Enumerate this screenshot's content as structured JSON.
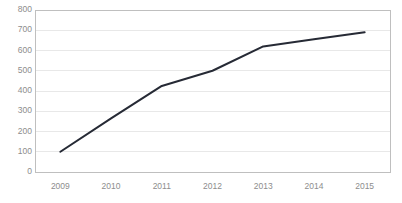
{
  "chart_data": {
    "type": "line",
    "title": "",
    "xlabel": "",
    "ylabel": "",
    "categories": [
      "2009",
      "2010",
      "2011",
      "2012",
      "2013",
      "2014",
      "2015"
    ],
    "x": [
      2009,
      2010,
      2011,
      2012,
      2013,
      2014,
      2015
    ],
    "values": [
      100,
      265,
      425,
      500,
      620,
      655,
      690
    ],
    "series": [
      {
        "name": "",
        "values": [
          100,
          265,
          425,
          500,
          620,
          655,
          690
        ],
        "color": "#262a35",
        "line_width": 2
      }
    ],
    "ylim": [
      0,
      800
    ],
    "ytick_values": [
      0,
      100,
      200,
      300,
      400,
      500,
      600,
      700,
      800
    ],
    "ytick_labels": [
      "0",
      "100",
      "200",
      "300",
      "400",
      "500",
      "600",
      "700",
      "800"
    ],
    "xtick_labels": [
      "2009",
      "2010",
      "2011",
      "2012",
      "2013",
      "2014",
      "2015"
    ],
    "grid": {
      "horizontal": true,
      "vertical": false,
      "color": "#e8e8e8"
    },
    "legend": {
      "visible": false,
      "position": "none",
      "entries": []
    },
    "plot_area": {
      "left": 35,
      "top": 10,
      "right": 390,
      "bottom": 172,
      "border_color": "#bfbfbf",
      "background": "#ffffff"
    },
    "axis": {
      "x_axis_color": "#bfbfbf",
      "y_axis_color": "#bfbfbf",
      "tick_label_color": "#8d8d8d"
    }
  },
  "colors": {
    "background": "#ffffff",
    "line": "#262a35",
    "gridline": "#e8e8e8",
    "axis": "#bfbfbf",
    "tick_text": "#8d8d8d",
    "title_text": "#e2e2e2"
  }
}
